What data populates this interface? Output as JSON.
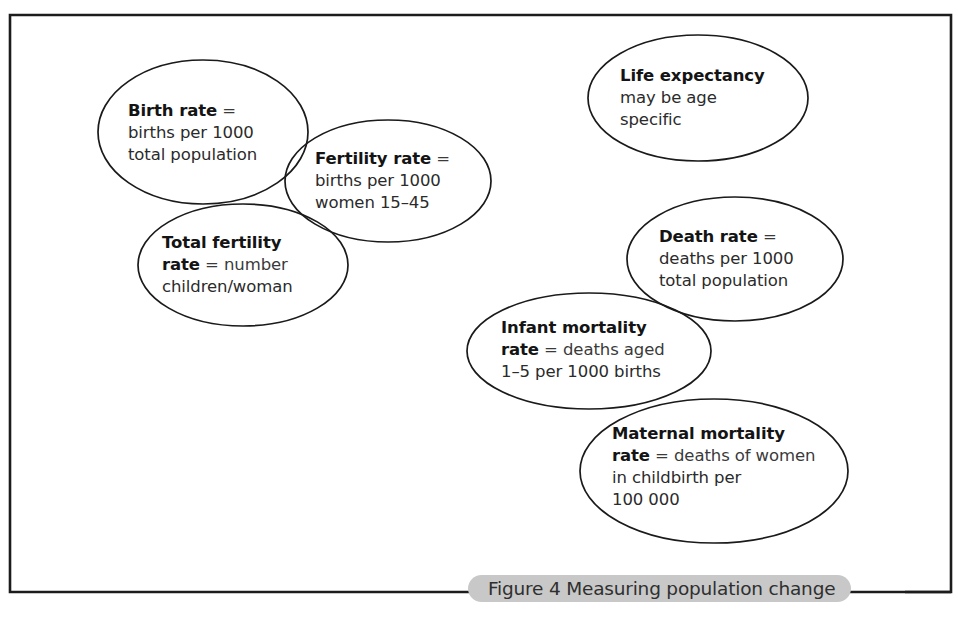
{
  "figure": {
    "caption": "Figure 4 Measuring population change",
    "caption_number": "4",
    "frame_color": "#1c1c1c",
    "caption_pill_color": "#c8c8c8",
    "ellipse_stroke_color": "#1a1a1a",
    "background_color": "#ffffff"
  },
  "nodes": [
    {
      "id": "birth-rate",
      "term": "Birth rate",
      "equals": "=",
      "lines": [
        "births per 1000",
        "total population"
      ],
      "cx": 203,
      "cy": 132,
      "rx": 105,
      "ry": 72
    },
    {
      "id": "fertility-rate",
      "term": "Fertility rate",
      "equals": "=",
      "lines": [
        "births per 1000",
        "women 15–45"
      ],
      "cx": 388,
      "cy": 181,
      "rx": 103,
      "ry": 61
    },
    {
      "id": "total-fertility-rate",
      "term": "Total fertility rate",
      "equals": "=",
      "lines": [
        "number",
        "children/woman"
      ],
      "cx": 243,
      "cy": 265,
      "rx": 105,
      "ry": 61
    },
    {
      "id": "life-expectancy",
      "term": "Life expectancy",
      "equals": "",
      "lines": [
        "may be age",
        "specific"
      ],
      "cx": 698,
      "cy": 98,
      "rx": 110,
      "ry": 63
    },
    {
      "id": "death-rate",
      "term": "Death rate",
      "equals": "=",
      "lines": [
        "deaths per 1000",
        "total population"
      ],
      "cx": 735,
      "cy": 259,
      "rx": 108,
      "ry": 62
    },
    {
      "id": "infant-mortality-rate",
      "term": "Infant mortality rate",
      "equals": "=",
      "lines": [
        "deaths aged",
        "1–5 per 1000 births"
      ],
      "cx": 589,
      "cy": 351,
      "rx": 122,
      "ry": 58
    },
    {
      "id": "maternal-mortality-rate",
      "term": "Maternal mortality rate",
      "equals": "=",
      "lines": [
        "deaths of women",
        "in childbirth per",
        "100 000"
      ],
      "cx": 714,
      "cy": 471,
      "rx": 134,
      "ry": 72
    }
  ],
  "text_blocks": {
    "birth_rate": {
      "l1_bold": "Birth rate",
      "l1_eq": " =",
      "l2": "births per 1000",
      "l3": "total population"
    },
    "fertility_rate": {
      "l1_bold": "Fertility rate",
      "l1_eq": " =",
      "l2": "births per 1000",
      "l3": "women 15–45"
    },
    "total_fertility_rate": {
      "l1_bold": "Total fertility",
      "l2_bold": "rate",
      "l2_rest": " = number",
      "l3": "children/woman"
    },
    "life_expectancy": {
      "l1_bold": "Life expectancy",
      "l2": "may be age",
      "l3": "specific"
    },
    "death_rate": {
      "l1_bold": "Death rate",
      "l1_eq": " =",
      "l2": "deaths per 1000",
      "l3": "total population"
    },
    "infant_mortality_rate": {
      "l1_bold": "Infant mortality",
      "l2_bold": "rate",
      "l2_rest": " = deaths aged",
      "l3": "1–5 per 1000 births"
    },
    "maternal_mortality_rate": {
      "l1_bold": "Maternal mortality",
      "l2_bold": "rate",
      "l2_rest": " = deaths of women",
      "l3": "in childbirth per",
      "l4": "100 000"
    }
  }
}
